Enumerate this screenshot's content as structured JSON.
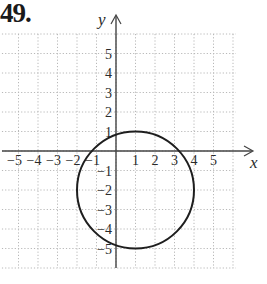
{
  "problem": {
    "number_label": "49."
  },
  "chart_data": {
    "type": "scatter",
    "subtype": "circle-graph",
    "title": "",
    "xlabel": "x",
    "ylabel": "y",
    "xlim": [
      -6,
      6
    ],
    "ylim": [
      -6,
      6
    ],
    "grid": true,
    "grid_style": "dotted",
    "x_ticks": [
      "-5",
      "-4",
      "-3",
      "-2",
      "-1",
      "1",
      "2",
      "3",
      "4",
      "5"
    ],
    "y_ticks": [
      "5",
      "4",
      "3",
      "2",
      "1",
      "-1",
      "-2",
      "-3",
      "-4",
      "-5"
    ],
    "circle": {
      "center": [
        1,
        -2
      ],
      "radius": 3
    },
    "series": [
      {
        "name": "circle",
        "points": [
          [
            -2,
            -2
          ],
          [
            4,
            -2
          ],
          [
            1,
            1
          ],
          [
            1,
            -5
          ]
        ]
      }
    ]
  },
  "colors": {
    "grid": "#b8b8b8",
    "axis": "#444444",
    "curve": "#1e1e1e",
    "text": "#2a2a2a"
  }
}
